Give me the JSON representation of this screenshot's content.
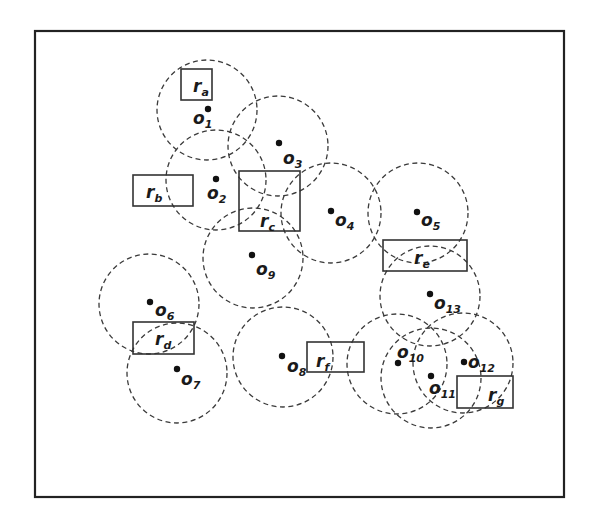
{
  "diagram": {
    "title": "",
    "frame": {
      "x": 35,
      "y": 31,
      "width": 529,
      "height": 466
    },
    "circle_radius": 50,
    "objects": [
      {
        "id": "o1",
        "base": "o",
        "sub": "1",
        "dot": [
          208,
          109
        ],
        "center": [
          207,
          110
        ],
        "label": [
          193,
          124
        ]
      },
      {
        "id": "o2",
        "base": "o",
        "sub": "2",
        "dot": [
          216,
          179
        ],
        "center": [
          216,
          180
        ],
        "label": [
          207,
          199
        ]
      },
      {
        "id": "o3",
        "base": "o",
        "sub": "3",
        "dot": [
          279,
          143
        ],
        "center": [
          278,
          146
        ],
        "label": [
          283,
          164
        ]
      },
      {
        "id": "o4",
        "base": "o",
        "sub": "4",
        "dot": [
          331,
          211
        ],
        "center": [
          331,
          213
        ],
        "label": [
          335,
          226
        ]
      },
      {
        "id": "o5",
        "base": "o",
        "sub": "5",
        "dot": [
          417,
          212
        ],
        "center": [
          418,
          213
        ],
        "label": [
          421,
          226
        ]
      },
      {
        "id": "o6",
        "base": "o",
        "sub": "6",
        "dot": [
          150,
          302
        ],
        "center": [
          149,
          304
        ],
        "label": [
          155,
          316
        ]
      },
      {
        "id": "o7",
        "base": "o",
        "sub": "7",
        "dot": [
          177,
          369
        ],
        "center": [
          177,
          373
        ],
        "label": [
          181,
          385
        ]
      },
      {
        "id": "o8",
        "base": "o",
        "sub": "8",
        "dot": [
          282,
          356
        ],
        "center": [
          283,
          357
        ],
        "label": [
          287,
          372
        ]
      },
      {
        "id": "o9",
        "base": "o",
        "sub": "9",
        "dot": [
          252,
          255
        ],
        "center": [
          253,
          258
        ],
        "label": [
          256,
          275
        ]
      },
      {
        "id": "o10",
        "base": "o",
        "sub": "10",
        "dot": [
          398,
          363
        ],
        "center": [
          397,
          364
        ],
        "label": [
          397,
          358
        ]
      },
      {
        "id": "o11",
        "base": "o",
        "sub": "11",
        "dot": [
          431,
          376
        ],
        "center": [
          431,
          378
        ],
        "label": [
          429,
          394
        ]
      },
      {
        "id": "o12",
        "base": "o",
        "sub": "12",
        "dot": [
          464,
          362
        ],
        "center": [
          463,
          363
        ],
        "label": [
          468,
          368
        ]
      },
      {
        "id": "o13",
        "base": "o",
        "sub": "13",
        "dot": [
          430,
          294
        ],
        "center": [
          430,
          296
        ],
        "label": [
          434,
          309
        ]
      }
    ],
    "regions": [
      {
        "id": "ra",
        "base": "r",
        "sub": "a",
        "x": 181,
        "y": 69,
        "width": 31,
        "height": 31,
        "label": [
          193,
          92
        ]
      },
      {
        "id": "rb",
        "base": "r",
        "sub": "b",
        "x": 133,
        "y": 175,
        "width": 60,
        "height": 31,
        "label": [
          146,
          198
        ]
      },
      {
        "id": "rc",
        "base": "r",
        "sub": "c",
        "x": 239,
        "y": 171,
        "width": 61,
        "height": 60,
        "label": [
          260,
          227
        ]
      },
      {
        "id": "rd",
        "base": "r",
        "sub": "d",
        "x": 133,
        "y": 322,
        "width": 61,
        "height": 32,
        "label": [
          155,
          345
        ]
      },
      {
        "id": "re",
        "base": "r",
        "sub": "e",
        "x": 383,
        "y": 240,
        "width": 84,
        "height": 31,
        "label": [
          414,
          264
        ]
      },
      {
        "id": "rf",
        "base": "r",
        "sub": "f",
        "x": 307,
        "y": 342,
        "width": 57,
        "height": 30,
        "label": [
          316,
          367
        ]
      },
      {
        "id": "rg",
        "base": "r",
        "sub": "g",
        "x": 457,
        "y": 376,
        "width": 56,
        "height": 32,
        "label": [
          488,
          401
        ]
      }
    ]
  }
}
